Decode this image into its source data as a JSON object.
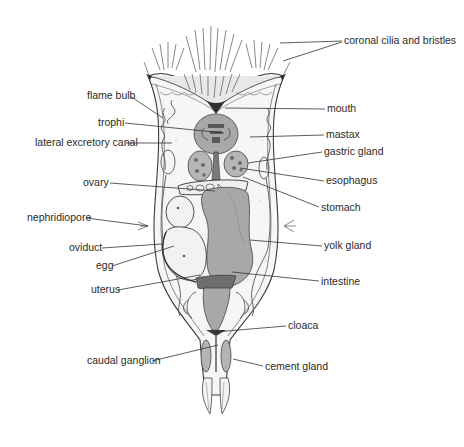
{
  "figure": {
    "colors": {
      "background": "#ffffff",
      "organ_fill": "#a8a8a8",
      "line": "#333333",
      "text": "#2a2a2a"
    }
  },
  "labels": {
    "left": [
      {
        "id": "flame-bulb",
        "text": "flame bulb",
        "x": 87,
        "y": 99,
        "tx": 163,
        "ty": 118
      },
      {
        "id": "trophi",
        "text": "trophi",
        "x": 98,
        "y": 126,
        "tx": 224,
        "ty": 133
      },
      {
        "id": "lateral-excretory-canal",
        "text": "lateral excretory canal",
        "x": 35,
        "y": 146,
        "tx": 172,
        "ty": 143
      },
      {
        "id": "ovary",
        "text": "ovary",
        "x": 83,
        "y": 186,
        "tx": 215,
        "ty": 191
      },
      {
        "id": "nephridiopore",
        "text": "nephridiopore",
        "x": 27,
        "y": 221,
        "tx": 148,
        "ty": 226
      },
      {
        "id": "oviduct",
        "text": "oviduct",
        "x": 69,
        "y": 251,
        "tx": 162,
        "ty": 244
      },
      {
        "id": "egg",
        "text": "egg",
        "x": 96,
        "y": 269,
        "tx": 174,
        "ty": 246
      },
      {
        "id": "uterus",
        "text": "uterus",
        "x": 91,
        "y": 293,
        "tx": 200,
        "ty": 275
      },
      {
        "id": "caudal-ganglion",
        "text": "caudal ganglion",
        "x": 87,
        "y": 364,
        "tx": 218,
        "ty": 345
      }
    ],
    "right": [
      {
        "id": "coronal-cilia-and-bristles",
        "text": "coronal cilia and bristles",
        "x": 344,
        "y": 44,
        "tx": 280,
        "ty": 43,
        "tx2": 283,
        "ty2": 61
      },
      {
        "id": "mouth",
        "text": "mouth",
        "x": 327,
        "y": 112,
        "tx": 225,
        "ty": 108
      },
      {
        "id": "mastax",
        "text": "mastax",
        "x": 326,
        "y": 138,
        "tx": 250,
        "ty": 137
      },
      {
        "id": "gastric-gland",
        "text": "gastric gland",
        "x": 324,
        "y": 155,
        "tx": 248,
        "ty": 163
      },
      {
        "id": "esophagus",
        "text": "esophagus",
        "x": 326,
        "y": 184,
        "tx": 240,
        "ty": 168
      },
      {
        "id": "stomach",
        "text": "stomach",
        "x": 321,
        "y": 211,
        "tx": 243,
        "ty": 177
      },
      {
        "id": "yolk-gland",
        "text": "yolk gland",
        "x": 324,
        "y": 249,
        "tx": 250,
        "ty": 240
      },
      {
        "id": "intestine",
        "text": "intestine",
        "x": 321,
        "y": 285,
        "tx": 232,
        "ty": 272
      },
      {
        "id": "cloaca",
        "text": "cloaca",
        "x": 288,
        "y": 329,
        "tx": 215,
        "ty": 332
      },
      {
        "id": "cement-gland",
        "text": "cement gland",
        "x": 265,
        "y": 370,
        "tx": 233,
        "ty": 359
      }
    ]
  }
}
